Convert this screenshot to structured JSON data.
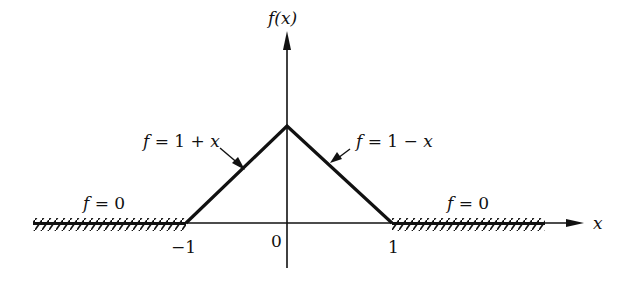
{
  "diagram": {
    "y_axis_label": "f(x)",
    "x_axis_label": "x",
    "tick_labels": {
      "neg_one": "−1",
      "zero": "0",
      "one": "1"
    },
    "regions": {
      "left_zero": "f = 0",
      "left_slope": "f = 1 + x",
      "right_slope": "f = 1 − x",
      "right_zero": "f = 0"
    }
  },
  "chart_data": {
    "type": "line",
    "title": "",
    "xlabel": "x",
    "ylabel": "f(x)",
    "series": [
      {
        "name": "f(x)",
        "x": [
          -2.5,
          -1,
          0,
          1,
          2.5
        ],
        "y": [
          0,
          0,
          1,
          1,
          0
        ]
      }
    ],
    "annotations": [
      "f = 0 (x < -1)",
      "f = 1 + x (-1 ≤ x ≤ 0)",
      "f = 1 − x (0 ≤ x ≤ 1)",
      "f = 0 (x > 1)"
    ],
    "x_ticks": [
      "-1",
      "0",
      "1"
    ],
    "grid": false
  }
}
